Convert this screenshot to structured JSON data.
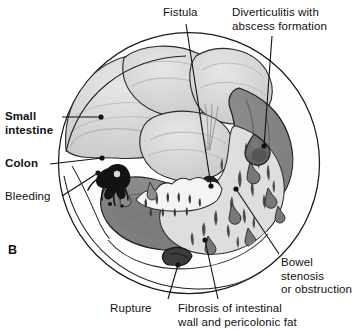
{
  "figure": {
    "panel_letter": "B",
    "colors": {
      "outline": "#1a1a1a",
      "small_intestine": "#d5d5d5",
      "small_intestine_shade": "#c2c2c2",
      "colon": "#8d8d8d",
      "colon_dark": "#6f6f6f",
      "fibrosis_fat": "#dcdcdc",
      "diverticula": "#5a5a5a",
      "bleeding": "#151515",
      "abscess": "#676767",
      "background": "#ffffff",
      "label_text": "#111111"
    }
  },
  "labels": [
    {
      "id": "fistula",
      "text": "Fistula",
      "bold": false,
      "x": 163,
      "y": 6,
      "leader": {
        "x1": 186,
        "y1": 24,
        "x2": 211,
        "y2": 186
      },
      "dot": true
    },
    {
      "id": "diverticulitis-abscess",
      "text": "Diverticulitis with\nabscess formation",
      "bold": false,
      "x": 232,
      "y": 6,
      "leader": {
        "x1": 272,
        "y1": 36,
        "x2": 264,
        "y2": 146
      },
      "dot": true
    },
    {
      "id": "small-intestine",
      "text": "Small\nintestine",
      "bold": true,
      "x": 5,
      "y": 110,
      "leader": {
        "x1": 62,
        "y1": 117,
        "x2": 101,
        "y2": 117
      },
      "dot": true
    },
    {
      "id": "colon",
      "text": "Colon",
      "bold": true,
      "x": 5,
      "y": 157,
      "leader": {
        "x1": 50,
        "y1": 164,
        "x2": 102,
        "y2": 158
      },
      "dot": true
    },
    {
      "id": "bleeding",
      "text": "Bleeding",
      "bold": false,
      "x": 5,
      "y": 190,
      "leader": {
        "x1": 62,
        "y1": 196,
        "x2": 98,
        "y2": 173
      },
      "dot": true
    },
    {
      "id": "bowel-stenosis",
      "text": "Bowel\nstenosis\nor obstruction",
      "bold": false,
      "x": 281,
      "y": 256,
      "leader": {
        "x1": 279,
        "y1": 254,
        "x2": 236,
        "y2": 189
      },
      "dot": true
    },
    {
      "id": "rupture",
      "text": "Rupture",
      "bold": false,
      "x": 110,
      "y": 302,
      "leader": {
        "x1": 168,
        "y1": 299,
        "x2": 178,
        "y2": 265
      },
      "dot": true
    },
    {
      "id": "fibrosis",
      "text": "Fibrosis of intestinal\nwall and pericolonic fat",
      "bold": false,
      "x": 178,
      "y": 302,
      "leader": {
        "x1": 218,
        "y1": 299,
        "x2": 205,
        "y2": 240
      },
      "dot": true
    }
  ],
  "structures": {
    "outer_circle": {
      "cx": 189,
      "cy": 163,
      "r": 131
    },
    "legend_note": "grayscale medical line drawing"
  }
}
